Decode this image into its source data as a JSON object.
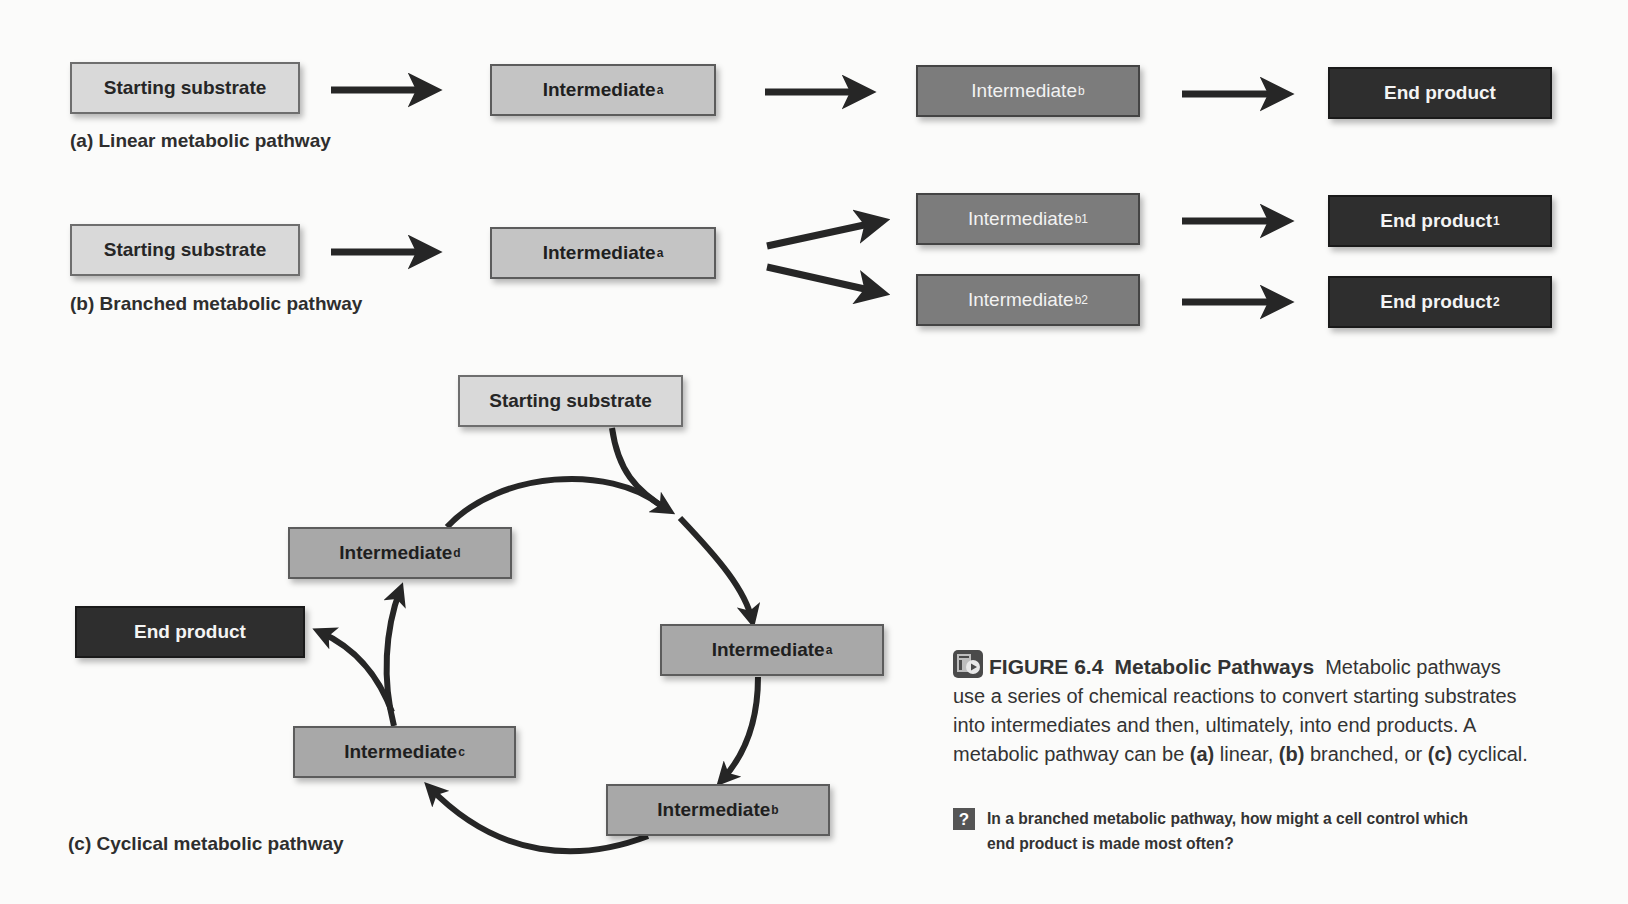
{
  "figure": {
    "number_label": "FIGURE 6.4",
    "title": "Metabolic Pathways",
    "caption_parts": {
      "lead": "Metabolic pathways use a series of chemical reactions to convert starting substrates into intermediates and then, ultimately, into end products. A metabolic pathway can be",
      "a_marker": "(a)",
      "a_text": "linear,",
      "b_marker": "(b)",
      "b_text": "branched, or",
      "c_marker": "(c)",
      "c_text": "cyclical."
    },
    "question_icon": "?",
    "question": "In a branched metabolic pathway, how might a cell control which end product is made most often?",
    "icon": "video-icon"
  },
  "linear": {
    "label": "(a) Linear metabolic pathway",
    "nodes": [
      {
        "text": "Starting substrate",
        "sub": ""
      },
      {
        "text": "Intermediate",
        "sub": "a"
      },
      {
        "text": "Intermediate",
        "sub": "b"
      },
      {
        "text": "End product",
        "sub": ""
      }
    ]
  },
  "branched": {
    "label": "(b) Branched metabolic pathway",
    "nodes": [
      {
        "text": "Starting substrate",
        "sub": ""
      },
      {
        "text": "Intermediate",
        "sub": "a"
      },
      {
        "text": "Intermediate",
        "sub": "b1"
      },
      {
        "text": "Intermediate",
        "sub": "b2"
      },
      {
        "text": "End product",
        "sub": "1"
      },
      {
        "text": "End product",
        "sub": "2"
      }
    ]
  },
  "cyclical": {
    "label": "(c) Cyclical metabolic pathway",
    "nodes": [
      {
        "text": "Starting substrate",
        "sub": ""
      },
      {
        "text": "Intermediate",
        "sub": "a"
      },
      {
        "text": "Intermediate",
        "sub": "b"
      },
      {
        "text": "Intermediate",
        "sub": "c"
      },
      {
        "text": "Intermediate",
        "sub": "d"
      },
      {
        "text": "End product",
        "sub": ""
      }
    ]
  },
  "colors": {
    "substrate": "#d9d9d9",
    "intermediate_light": "#a8a8a8",
    "intermediate_dark": "#7c7c7c",
    "end_product": "#2e2e2e",
    "arrow": "#262626"
  }
}
